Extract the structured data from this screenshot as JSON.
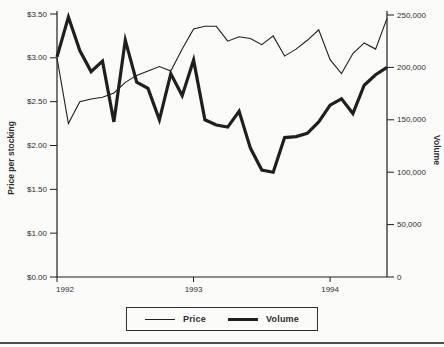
{
  "chart_data": {
    "type": "line",
    "title": "",
    "x": [
      "Jan-92",
      "Feb-92",
      "Mar-92",
      "Apr-92",
      "May-92",
      "Jun-92",
      "Jul-92",
      "Aug-92",
      "Sep-92",
      "Oct-92",
      "Nov-92",
      "Dec-92",
      "Jan-93",
      "Feb-93",
      "Mar-93",
      "Apr-93",
      "May-93",
      "Jun-93",
      "Jul-93",
      "Aug-93",
      "Sep-93",
      "Oct-93",
      "Nov-93",
      "Dec-93",
      "Jan-94",
      "Feb-94",
      "Mar-94",
      "Apr-94",
      "May-94",
      "Jun-94"
    ],
    "x_axis": {
      "tick_labels": [
        "1992",
        "1993",
        "1994"
      ],
      "tick_indices": [
        0,
        12,
        24
      ]
    },
    "y_left": {
      "title": "Price per stocking",
      "tick_labels": [
        "$3.50",
        "$3.00",
        "$2.50",
        "$2.00",
        "$1.50",
        "$1.00",
        "$0.00"
      ],
      "top_value": 3.5,
      "value_per_tick": 0.5
    },
    "y_right": {
      "title": "Volume",
      "tick_labels": [
        "250,000",
        "200,000",
        "150,000",
        "100,000",
        "50,000",
        "0"
      ],
      "max": 250000
    },
    "series": [
      {
        "name": "Price",
        "axis": "left",
        "line_weight": "thin",
        "values": [
          3.0,
          2.25,
          2.5,
          2.53,
          2.55,
          2.6,
          2.72,
          2.8,
          2.85,
          2.9,
          2.85,
          3.1,
          3.33,
          3.36,
          3.36,
          3.19,
          3.24,
          3.22,
          3.15,
          3.25,
          3.02,
          3.1,
          3.2,
          3.32,
          2.98,
          2.82,
          3.05,
          3.17,
          3.1,
          3.45
        ]
      },
      {
        "name": "Volume",
        "axis": "right",
        "line_weight": "thick",
        "values": [
          210000,
          248000,
          216000,
          196000,
          206000,
          148000,
          226000,
          186000,
          180000,
          150000,
          194000,
          173000,
          207000,
          150000,
          145000,
          143000,
          158000,
          123000,
          102000,
          100000,
          133000,
          134000,
          137000,
          148000,
          164000,
          170000,
          156000,
          183000,
          193000,
          200000
        ]
      }
    ],
    "legend": {
      "position": "bottom-center",
      "items": [
        {
          "label": "Price",
          "sample": "thin-line"
        },
        {
          "label": "Volume",
          "sample": "thick-line"
        }
      ]
    },
    "grid": false,
    "colors": {
      "line": "#1f1f1f",
      "text": "#2e2e2e",
      "background": "#fbfbf9",
      "bottom_rule": "#4f4f4f"
    }
  }
}
